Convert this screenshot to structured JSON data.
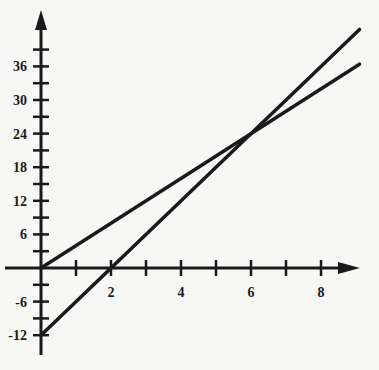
{
  "chart_data": {
    "type": "line",
    "title": "",
    "xlabel": "",
    "ylabel": "",
    "xlim": [
      0,
      9.1
    ],
    "ylim": [
      -14,
      43
    ],
    "x_ticks": [
      2,
      4,
      6,
      8
    ],
    "x_tick_labels": [
      "2",
      "4",
      "6",
      "8"
    ],
    "x_minor_ticks": [
      1,
      2,
      3,
      4,
      5,
      6,
      7,
      8
    ],
    "y_ticks": [
      36,
      30,
      24,
      18,
      12,
      6,
      -6,
      -12
    ],
    "y_tick_labels": [
      "36",
      "30",
      "24",
      "18",
      "12",
      "6",
      "-6",
      "-12"
    ],
    "y_minor_ticks": [
      39,
      36,
      33,
      30,
      27,
      24,
      21,
      18,
      15,
      12,
      9,
      6,
      3,
      -3,
      -6,
      -9,
      -12
    ],
    "grid": false,
    "legend": null,
    "series": [
      {
        "name": "y = 4x",
        "x": [
          0,
          9
        ],
        "y": [
          0,
          36
        ],
        "color": "#1a1a1a"
      },
      {
        "name": "y = 6x - 12",
        "x": [
          0,
          9
        ],
        "y": [
          -12,
          42
        ],
        "color": "#1a1a1a"
      }
    ],
    "intersection": {
      "x": 6,
      "y": 24
    }
  },
  "colors": {
    "background": "#f7f7f5",
    "ink": "#1a1a1a"
  }
}
